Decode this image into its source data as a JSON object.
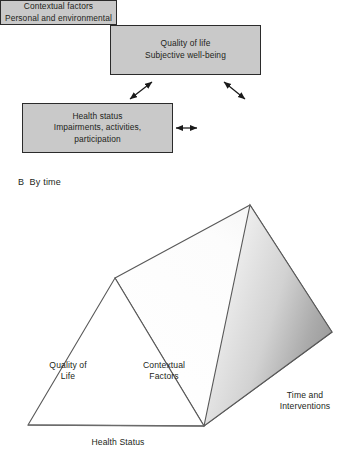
{
  "panel_a": {
    "boxes": [
      {
        "name": "quality-of-life",
        "text": "Quality of life\nSubjective well-being",
        "fill": "#c9c9c9",
        "border": "#2b2b2b"
      },
      {
        "name": "health-status",
        "text": "Health status\nImpairments, activities,\nparticipation",
        "fill": "#c9c9c9",
        "border": "#2b2b2b"
      },
      {
        "name": "contextual-factors",
        "text": "Contextual factors\nPersonal and environmental",
        "fill": "#c9c9c9",
        "border": "#2b2b2b"
      }
    ],
    "connectors": [
      {
        "name": "quality-of-life-to-health-status",
        "style": "double-headed-arrow"
      },
      {
        "name": "quality-of-life-to-contextual-factors",
        "style": "double-headed-arrow"
      },
      {
        "name": "health-status-to-contextual-factors",
        "style": "double-headed-arrow"
      }
    ]
  },
  "panel_b": {
    "label": "B  By time",
    "diagram": {
      "type": "triangular-prism",
      "face_fill": "#ffffff",
      "side_gradient": [
        "#efefef",
        "#a8a8a8"
      ],
      "stroke": "#555555"
    },
    "labels": {
      "quality_of_life": "Quality of\nLife",
      "contextual_factors": "Contextual\nFactors",
      "time_and_interventions": "Time and\nInterventions",
      "health_status": "Health Status"
    }
  }
}
